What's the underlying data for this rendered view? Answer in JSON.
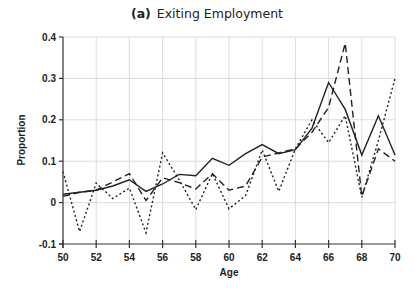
{
  "chart_data": {
    "type": "line",
    "title_tag": "(a)",
    "title": "Exiting Employment",
    "xlabel": "Age",
    "ylabel": "Proportion",
    "xlim": [
      50,
      70
    ],
    "ylim": [
      -0.1,
      0.4
    ],
    "xticks": [
      50,
      52,
      54,
      56,
      58,
      60,
      62,
      64,
      66,
      68,
      70
    ],
    "yticks": [
      -0.1,
      0,
      0.1,
      0.2,
      0.3,
      0.4
    ],
    "ytick_labels": [
      "-0.1",
      "0",
      "0.1",
      "0.2",
      "0.3",
      "0.4"
    ],
    "grid": true,
    "legend": "none",
    "x": [
      50,
      51,
      52,
      53,
      54,
      55,
      56,
      57,
      58,
      59,
      60,
      61,
      62,
      63,
      64,
      65,
      66,
      67,
      68,
      69,
      70
    ],
    "series": [
      {
        "name": "solid",
        "style": "solid",
        "values": [
          0.02,
          0.025,
          0.03,
          0.04,
          0.055,
          0.027,
          0.045,
          0.068,
          0.065,
          0.107,
          0.09,
          0.118,
          0.14,
          0.118,
          0.128,
          0.18,
          0.29,
          0.225,
          0.115,
          0.21,
          0.115
        ]
      },
      {
        "name": "dashed",
        "style": "dashed",
        "values": [
          0.015,
          0.025,
          0.03,
          0.05,
          0.07,
          0.005,
          0.06,
          0.048,
          0.033,
          0.07,
          0.03,
          0.04,
          0.11,
          0.12,
          0.13,
          0.17,
          0.23,
          0.385,
          0.015,
          0.13,
          0.1
        ]
      },
      {
        "name": "dotted",
        "style": "dotted",
        "values": [
          0.075,
          -0.07,
          0.047,
          0.01,
          0.035,
          -0.073,
          0.12,
          0.055,
          -0.017,
          0.07,
          -0.015,
          0.017,
          0.127,
          0.027,
          0.13,
          0.2,
          0.145,
          0.21,
          0.013,
          0.15,
          0.3
        ]
      }
    ]
  }
}
